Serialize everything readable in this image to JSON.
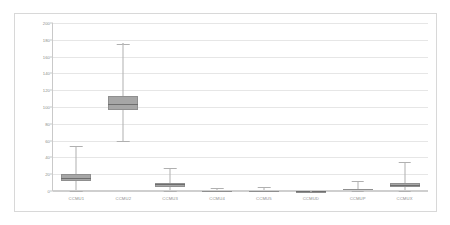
{
  "chart_data": {
    "type": "box",
    "title": "",
    "xlabel": "",
    "ylabel": "",
    "ylim": [
      0,
      200
    ],
    "ytick_step": 20,
    "yticks": [
      0,
      20,
      40,
      60,
      80,
      100,
      120,
      140,
      160,
      180,
      200
    ],
    "grid": true,
    "legend": "none",
    "categories": [
      "CCMU1",
      "CCMU2",
      "CCMU3",
      "CCMU4",
      "CCMU5",
      "CCMUD",
      "CCMUP",
      "CCMUX"
    ],
    "boxes": [
      {
        "label": "CCMU1",
        "whisker_low": 0,
        "q1": 12,
        "median": 16,
        "q3": 20,
        "whisker_high": 54,
        "outliers": []
      },
      {
        "label": "CCMU2",
        "whisker_low": 60,
        "q1": 97,
        "median": 104,
        "q3": 113,
        "whisker_high": 175,
        "outliers": [
          177
        ]
      },
      {
        "label": "CCMU3",
        "whisker_low": 0,
        "q1": 5,
        "median": 8,
        "q3": 10,
        "whisker_high": 27,
        "outliers": []
      },
      {
        "label": "CCMU4",
        "whisker_low": 0,
        "q1": 0,
        "median": 1,
        "q3": 1,
        "whisker_high": 4,
        "outliers": []
      },
      {
        "label": "CCMU5",
        "whisker_low": 0,
        "q1": 0,
        "median": 1,
        "q3": 1,
        "whisker_high": 5,
        "outliers": []
      },
      {
        "label": "CCMUD",
        "whisker_low": 0,
        "q1": 0,
        "median": 0,
        "q3": 0,
        "whisker_high": 0,
        "outliers": [
          2
        ]
      },
      {
        "label": "CCMUP",
        "whisker_low": 0,
        "q1": 0,
        "median": 1,
        "q3": 2,
        "whisker_high": 12,
        "outliers": []
      },
      {
        "label": "CCMUX",
        "whisker_low": 0,
        "q1": 5,
        "median": 7,
        "q3": 9,
        "whisker_high": 35,
        "outliers": []
      }
    ],
    "colors": {
      "box_fill": "#a6a6a6",
      "box_border": "#8f8f8f",
      "median": "#6e6e6e",
      "whisker": "#b0b0b0",
      "gridline": "#e6e6e6",
      "axis": "#c9c9c9",
      "tick_text": "#8c8c8c",
      "frame": "#d8d8d8",
      "background": "#ffffff"
    }
  }
}
